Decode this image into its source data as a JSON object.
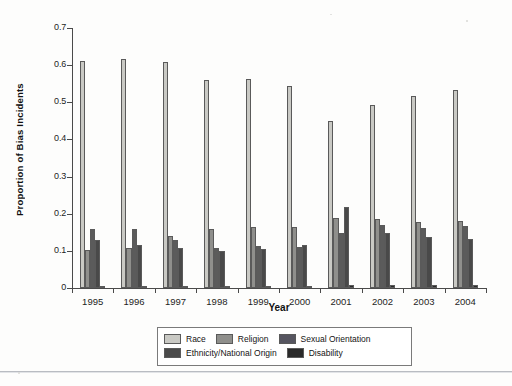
{
  "chart_data": {
    "type": "bar",
    "title": "",
    "xlabel": "Year",
    "ylabel": "Proportion of Bias Incidents",
    "categories": [
      "1995",
      "1996",
      "1997",
      "1998",
      "1999",
      "2000",
      "2001",
      "2002",
      "2003",
      "2004"
    ],
    "ylim": [
      0,
      0.7
    ],
    "ytick_labels": [
      "0",
      "0.1",
      "0.2",
      "0.3",
      "0.4",
      "0.5",
      "0.6",
      "0.7"
    ],
    "ytick_values": [
      0,
      0.1,
      0.2,
      0.3,
      0.4,
      0.5,
      0.6,
      0.7
    ],
    "grid": false,
    "legend_position": "bottom",
    "series": [
      {
        "name": "Race",
        "color": "#c9c9c4",
        "values": [
          0.61,
          0.617,
          0.608,
          0.56,
          0.562,
          0.544,
          0.45,
          0.492,
          0.517,
          0.534
        ]
      },
      {
        "name": "Religion",
        "color": "#8f8f8c",
        "values": [
          0.103,
          0.108,
          0.141,
          0.158,
          0.164,
          0.164,
          0.189,
          0.186,
          0.178,
          0.18
        ]
      },
      {
        "name": "Ethnicity/National Origin",
        "color": "#5b5b5b",
        "values": [
          0.16,
          0.16,
          0.128,
          0.109,
          0.113,
          0.111,
          0.148,
          0.17,
          0.162,
          0.166
        ]
      },
      {
        "name": "Sexual Orientation",
        "color": "#494949",
        "values": [
          0.128,
          0.117,
          0.107,
          0.099,
          0.106,
          0.116,
          0.217,
          0.147,
          0.138,
          0.131
        ]
      },
      {
        "name": "Disability",
        "color": "#2a2a2a",
        "values": [
          0.004,
          0.004,
          0.004,
          0.004,
          0.005,
          0.006,
          0.007,
          0.007,
          0.007,
          0.008
        ]
      }
    ],
    "series_draw_order": [
      "Race",
      "Religion",
      "Ethnicity/National Origin",
      "Sexual Orientation",
      "Disability"
    ]
  },
  "legend": {
    "rows": [
      [
        {
          "label": "Race",
          "color": "#c9c9c4"
        },
        {
          "label": "Religion",
          "color": "#8f8f8c"
        },
        {
          "label": "Sexual Orientation",
          "color": "#565560"
        }
      ],
      [
        {
          "label": "Ethnicity/National Origin",
          "color": "#4a4a4a"
        },
        {
          "label": "Disability",
          "color": "#2a2a2a"
        }
      ]
    ]
  }
}
